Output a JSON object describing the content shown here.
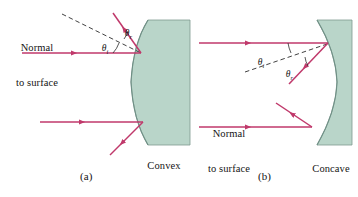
{
  "figure": {
    "colors": {
      "mirror_fill": "#b9d5c9",
      "mirror_edge": "#6f8f85",
      "ray": "#c0396b",
      "normal_dash": "#2b2b2b",
      "text": "#141414",
      "background": "#ffffff"
    },
    "panels": [
      {
        "id": "a",
        "caption": "(a)",
        "mirror_label_line1": "Convex",
        "mirror_label_line2": "mirror",
        "mirror_type": "convex",
        "normal_label_line1": "Normal",
        "normal_label_line2": "to surface",
        "angle_incidence": "θ",
        "angle_incidence_sub": "i",
        "angle_reflection": "θ",
        "angle_reflection_sub": "r",
        "rays": [
          {
            "name": "upper-incident-ray",
            "kind": "incident"
          },
          {
            "name": "upper-reflected-ray",
            "kind": "reflected"
          },
          {
            "name": "lower-incident-ray",
            "kind": "incident"
          },
          {
            "name": "lower-reflected-ray",
            "kind": "reflected"
          }
        ]
      },
      {
        "id": "b",
        "caption": "(b)",
        "mirror_label_line1": "Concave",
        "mirror_label_line2": "mirror",
        "mirror_type": "concave",
        "normal_label_line1": "Normal",
        "normal_label_line2": "to surface",
        "angle_incidence": "θ",
        "angle_incidence_sub": "i",
        "angle_reflection": "θ",
        "angle_reflection_sub": "r",
        "rays": [
          {
            "name": "upper-incident-ray",
            "kind": "incident"
          },
          {
            "name": "upper-reflected-ray",
            "kind": "reflected"
          },
          {
            "name": "lower-incident-ray",
            "kind": "incident"
          },
          {
            "name": "lower-reflected-ray",
            "kind": "reflected"
          }
        ]
      }
    ]
  }
}
